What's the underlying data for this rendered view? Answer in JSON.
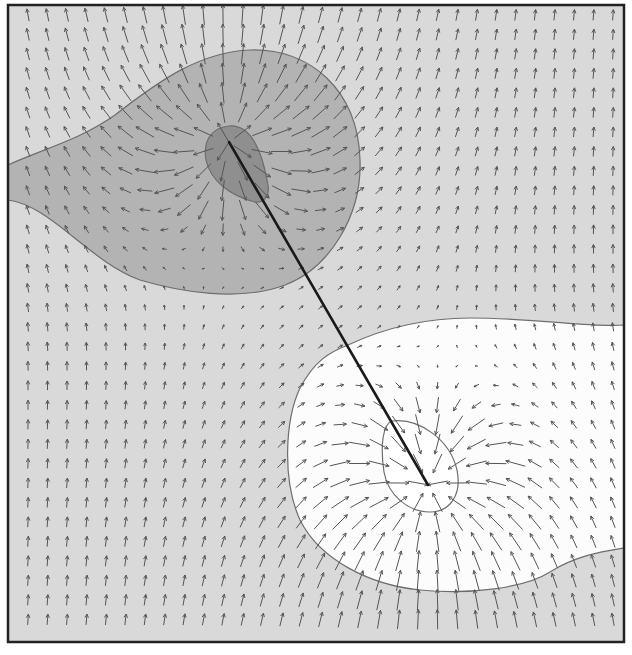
{
  "figure": {
    "width": 632,
    "height": 655,
    "frame": {
      "x": 8,
      "y": 5,
      "w": 616,
      "h": 637,
      "stroke": "#222222",
      "stroke_width": 2.5
    },
    "colors": {
      "background": "#d9d9d9",
      "dark_region": "#b3b3b3",
      "darker_core": "#8f8f8f",
      "white_region": "#fcfcfc",
      "white_core": "#ffffff",
      "contour_stroke": "#6e6e6e",
      "arrow": "#555555",
      "axis_line": "#1a1a1a"
    },
    "dipole": {
      "negative_center": {
        "x": 229,
        "y": 142
      },
      "positive_center": {
        "x": 428,
        "y": 485
      },
      "uniform_field": {
        "x": 0,
        "y": -1
      }
    },
    "arrow_grid": {
      "x0": 28,
      "y0": 15,
      "dx": 19.5,
      "dy": 19.5,
      "cols": 31,
      "rows": 32,
      "base_length": 11
    },
    "regions": {
      "dark_region_path": "M8,165 C40,150 80,140 115,115 C160,80 200,52 250,50 C310,48 358,90 360,160 C362,215 330,268 285,285 C240,302 180,292 140,280 C90,262 50,205 8,200 Z",
      "darker_core_path": "M229,126 C250,124 262,150 268,185 C270,198 262,203 255,202 C230,196 210,180 206,160 C203,142 210,128 229,126 Z",
      "white_region_path": "M348,345 C380,330 420,318 470,318 C540,318 590,328 624,325 L624,548 C600,552 575,556 550,572 C525,588 470,595 420,590 C370,585 320,560 300,520 C282,480 285,420 300,388 C315,360 330,352 348,345 Z",
      "white_core_path": "M392,421 C420,418 450,440 457,470 C462,495 450,512 430,512 C408,512 388,495 384,472 C380,445 383,424 392,421 Z"
    },
    "axis_line": {
      "x1": 229,
      "y1": 142,
      "x2": 428,
      "y2": 485
    }
  }
}
